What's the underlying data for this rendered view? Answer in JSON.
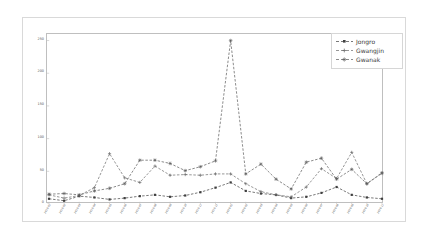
{
  "chart_data": {
    "type": "line",
    "title": "",
    "xlabel": "",
    "ylabel": "",
    "ylim": [
      0,
      260
    ],
    "yticks": [
      0,
      50,
      100,
      150,
      200,
      250
    ],
    "ytick_labels": [
      "0",
      "50",
      "100",
      "150",
      "200",
      "250"
    ],
    "grid": false,
    "legend_position": "upper right",
    "categories": [
      "2019-01",
      "2019-02",
      "2019-03",
      "2019-04",
      "2019-05",
      "2019-06",
      "2019-07",
      "2019-08",
      "2019-09",
      "2019-10",
      "2019-11",
      "2019-12",
      "2020-01",
      "2020-02",
      "2020-03",
      "2020-04",
      "2020-05",
      "2020-06",
      "2020-07",
      "2020-08",
      "2020-09",
      "2020-10",
      "2020-11"
    ],
    "series": [
      {
        "name": "Jongro",
        "color": "#3f3f3f",
        "linestyle": "dashed",
        "marker": "square",
        "values": [
          8,
          5,
          12,
          10,
          7,
          9,
          12,
          14,
          11,
          13,
          18,
          25,
          33,
          20,
          16,
          14,
          9,
          11,
          17,
          26,
          14,
          10,
          8
        ]
      },
      {
        "name": "Gwangjin",
        "color": "#6a6a6a",
        "linestyle": "dashed",
        "marker": "plus",
        "values": [
          14,
          9,
          13,
          25,
          77,
          40,
          33,
          58,
          44,
          45,
          44,
          46,
          46,
          31,
          19,
          14,
          11,
          26,
          54,
          39,
          79,
          31,
          48
        ]
      },
      {
        "name": "Gwanak",
        "color": "#5a5a5a",
        "linestyle": "dashed",
        "marker": "star",
        "values": [
          15,
          16,
          14,
          20,
          24,
          31,
          67,
          67,
          62,
          51,
          57,
          66,
          250,
          46,
          61,
          38,
          23,
          64,
          70,
          38,
          53,
          31,
          47
        ]
      }
    ]
  },
  "legend": {
    "items": [
      {
        "label": "Jongro"
      },
      {
        "label": "Gwangjin"
      },
      {
        "label": "Gwanak"
      }
    ]
  }
}
